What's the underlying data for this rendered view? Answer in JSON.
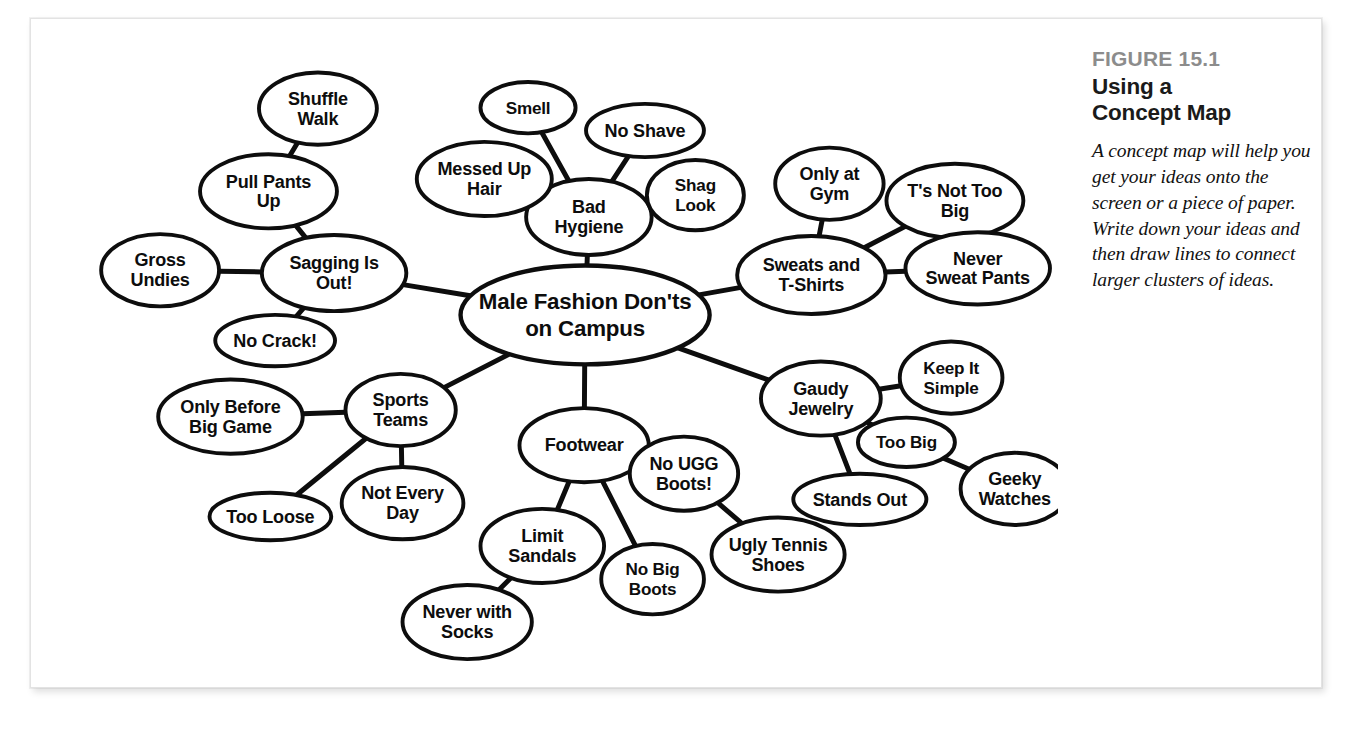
{
  "figure": {
    "number": "FIGURE 15.1",
    "title_line1": "Using a",
    "title_line2": "Concept Map",
    "body": "A concept map will help you get your ideas onto the screen or a piece of paper. Write down your ideas and then draw lines to connect larger clusters of ideas.",
    "number_color": "#8c8c8c",
    "title_color": "#1a1a1a",
    "ink_color": "#0d0d0d",
    "page_background": "#ffffff"
  },
  "chart_data": {
    "type": "diagram",
    "diagram_type": "concept-map",
    "root": "n-center",
    "nodes": [
      {
        "id": "n-center",
        "label_lines": [
          "Male Fashion Don'ts",
          "on Campus"
        ],
        "x": 549,
        "y": 306,
        "rx": 131,
        "ry": 52,
        "level": 0
      },
      {
        "id": "n-sagging",
        "label_lines": [
          "Sagging Is",
          "Out!"
        ],
        "x": 285,
        "y": 262,
        "rx": 76,
        "ry": 40,
        "level": 1
      },
      {
        "id": "n-pullpants",
        "label_lines": [
          "Pull Pants",
          "Up"
        ],
        "x": 216,
        "y": 176,
        "rx": 72,
        "ry": 39,
        "level": 2
      },
      {
        "id": "n-shuffle",
        "label_lines": [
          "Shuffle",
          "Walk"
        ],
        "x": 268,
        "y": 89,
        "rx": 62,
        "ry": 38,
        "level": 3
      },
      {
        "id": "n-gross",
        "label_lines": [
          "Gross",
          "Undies"
        ],
        "x": 102,
        "y": 259,
        "rx": 62,
        "ry": 38,
        "level": 2
      },
      {
        "id": "n-nocrack",
        "label_lines": [
          "No Crack!"
        ],
        "x": 223,
        "y": 333,
        "rx": 63,
        "ry": 27,
        "level": 2
      },
      {
        "id": "n-hygiene",
        "label_lines": [
          "Bad",
          "Hygiene"
        ],
        "x": 553,
        "y": 203,
        "rx": 66,
        "ry": 40,
        "level": 1
      },
      {
        "id": "n-smell",
        "label_lines": [
          "Smell"
        ],
        "x": 489,
        "y": 88,
        "rx": 50,
        "ry": 27,
        "level": 2
      },
      {
        "id": "n-messed",
        "label_lines": [
          "Messed Up",
          "Hair"
        ],
        "x": 443,
        "y": 163,
        "rx": 71,
        "ry": 39,
        "level": 2
      },
      {
        "id": "n-noshave",
        "label_lines": [
          "No Shave"
        ],
        "x": 612,
        "y": 112,
        "rx": 62,
        "ry": 28,
        "level": 2
      },
      {
        "id": "n-shag",
        "label_lines": [
          "Shag",
          "Look"
        ],
        "x": 665,
        "y": 180,
        "rx": 51,
        "ry": 37,
        "level": 2
      },
      {
        "id": "n-sweats",
        "label_lines": [
          "Sweats and",
          "T-Shirts"
        ],
        "x": 787,
        "y": 264,
        "rx": 78,
        "ry": 41,
        "level": 1
      },
      {
        "id": "n-onlygym",
        "label_lines": [
          "Only at",
          "Gym"
        ],
        "x": 806,
        "y": 168,
        "rx": 57,
        "ry": 38,
        "level": 2
      },
      {
        "id": "n-tsnottoobig",
        "label_lines": [
          "T's Not Too",
          "Big"
        ],
        "x": 938,
        "y": 186,
        "rx": 72,
        "ry": 39,
        "level": 2
      },
      {
        "id": "n-neversweat",
        "label_lines": [
          "Never",
          "Sweat Pants"
        ],
        "x": 962,
        "y": 257,
        "rx": 76,
        "ry": 38,
        "level": 2
      },
      {
        "id": "n-jewelry",
        "label_lines": [
          "Gaudy",
          "Jewelry"
        ],
        "x": 797,
        "y": 394,
        "rx": 63,
        "ry": 39,
        "level": 1
      },
      {
        "id": "n-keepsimple",
        "label_lines": [
          "Keep It",
          "Simple"
        ],
        "x": 934,
        "y": 372,
        "rx": 54,
        "ry": 38,
        "level": 2
      },
      {
        "id": "n-toobig",
        "label_lines": [
          "Too Big"
        ],
        "x": 887,
        "y": 440,
        "rx": 51,
        "ry": 26,
        "level": 2
      },
      {
        "id": "n-standsout",
        "label_lines": [
          "Stands Out"
        ],
        "x": 838,
        "y": 500,
        "rx": 70,
        "ry": 27,
        "level": 2
      },
      {
        "id": "n-geeky",
        "label_lines": [
          "Geeky",
          "Watches"
        ],
        "x": 1001,
        "y": 489,
        "rx": 57,
        "ry": 38,
        "level": 3
      },
      {
        "id": "n-sports",
        "label_lines": [
          "Sports",
          "Teams"
        ],
        "x": 355,
        "y": 406,
        "rx": 58,
        "ry": 38,
        "level": 1
      },
      {
        "id": "n-onlybefore",
        "label_lines": [
          "Only Before",
          "Big Game"
        ],
        "x": 176,
        "y": 413,
        "rx": 76,
        "ry": 39,
        "level": 2
      },
      {
        "id": "n-tooloose",
        "label_lines": [
          "Too Loose"
        ],
        "x": 218,
        "y": 518,
        "rx": 64,
        "ry": 25,
        "level": 2
      },
      {
        "id": "n-noteveryday",
        "label_lines": [
          "Not Every",
          "Day"
        ],
        "x": 357,
        "y": 504,
        "rx": 64,
        "ry": 38,
        "level": 2
      },
      {
        "id": "n-footwear",
        "label_lines": [
          "Footwear"
        ],
        "x": 548,
        "y": 443,
        "rx": 68,
        "ry": 39,
        "level": 1
      },
      {
        "id": "n-limitsandals",
        "label_lines": [
          "Limit",
          "Sandals"
        ],
        "x": 504,
        "y": 549,
        "rx": 65,
        "ry": 39,
        "level": 2
      },
      {
        "id": "n-neversocks",
        "label_lines": [
          "Never with",
          "Socks"
        ],
        "x": 425,
        "y": 629,
        "rx": 68,
        "ry": 39,
        "level": 3
      },
      {
        "id": "n-nobigboots",
        "label_lines": [
          "No Big",
          "Boots"
        ],
        "x": 620,
        "y": 584,
        "rx": 54,
        "ry": 37,
        "level": 2
      },
      {
        "id": "n-nougg",
        "label_lines": [
          "No UGG",
          "Boots!"
        ],
        "x": 653,
        "y": 473,
        "rx": 57,
        "ry": 39,
        "level": 2
      },
      {
        "id": "n-uglytennis",
        "label_lines": [
          "Ugly Tennis",
          "Shoes"
        ],
        "x": 752,
        "y": 558,
        "rx": 70,
        "ry": 39,
        "level": 3
      }
    ],
    "edges": [
      {
        "from": "n-center",
        "to": "n-sagging"
      },
      {
        "from": "n-center",
        "to": "n-hygiene"
      },
      {
        "from": "n-center",
        "to": "n-sweats"
      },
      {
        "from": "n-center",
        "to": "n-jewelry"
      },
      {
        "from": "n-center",
        "to": "n-sports"
      },
      {
        "from": "n-center",
        "to": "n-footwear"
      },
      {
        "from": "n-sagging",
        "to": "n-pullpants"
      },
      {
        "from": "n-pullpants",
        "to": "n-shuffle"
      },
      {
        "from": "n-sagging",
        "to": "n-gross"
      },
      {
        "from": "n-sagging",
        "to": "n-nocrack"
      },
      {
        "from": "n-hygiene",
        "to": "n-smell"
      },
      {
        "from": "n-hygiene",
        "to": "n-messed"
      },
      {
        "from": "n-hygiene",
        "to": "n-noshave"
      },
      {
        "from": "n-hygiene",
        "to": "n-shag"
      },
      {
        "from": "n-sweats",
        "to": "n-onlygym"
      },
      {
        "from": "n-sweats",
        "to": "n-tsnottoobig"
      },
      {
        "from": "n-sweats",
        "to": "n-neversweat"
      },
      {
        "from": "n-jewelry",
        "to": "n-keepsimple"
      },
      {
        "from": "n-jewelry",
        "to": "n-toobig"
      },
      {
        "from": "n-jewelry",
        "to": "n-standsout"
      },
      {
        "from": "n-toobig",
        "to": "n-geeky"
      },
      {
        "from": "n-sports",
        "to": "n-onlybefore"
      },
      {
        "from": "n-sports",
        "to": "n-tooloose"
      },
      {
        "from": "n-sports",
        "to": "n-noteveryday"
      },
      {
        "from": "n-footwear",
        "to": "n-limitsandals"
      },
      {
        "from": "n-limitsandals",
        "to": "n-neversocks"
      },
      {
        "from": "n-footwear",
        "to": "n-nobigboots"
      },
      {
        "from": "n-footwear",
        "to": "n-nougg"
      },
      {
        "from": "n-nougg",
        "to": "n-uglytennis"
      }
    ]
  }
}
